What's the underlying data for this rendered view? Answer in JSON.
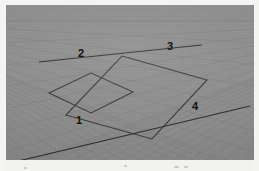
{
  "scene": {
    "title": "3D perspective grid viewport",
    "background_color": "#8d8d8d",
    "paper_color": "#f4f4f2",
    "grid_line_color": "#7c7c7c",
    "geometry_line_color": "#3a3a3a",
    "axis_line_color": "#2f2f2f",
    "label_color": "#141414",
    "canvas": {
      "x": 6,
      "y": 5,
      "width": 248,
      "height": 155
    }
  },
  "grid": {
    "name": "perspective-ground-grid",
    "description": "Ground plane grid receding to a horizon, drawn as two families of parallel lines",
    "horizon_y": 16,
    "family_a_count": 26,
    "family_b_count": 26
  },
  "axes": [
    {
      "id": "axis-1",
      "name": "axis-line-primary",
      "from": {
        "x": 4,
        "y": 158
      },
      "to": {
        "x": 244,
        "y": 101
      }
    },
    {
      "id": "axis-2",
      "name": "axis-line-secondary",
      "from": {
        "x": 33,
        "y": 57
      },
      "to": {
        "x": 196,
        "y": 40
      }
    }
  ],
  "shapes": [
    {
      "id": "quad-1",
      "name": "ground-quad-left",
      "points": "43,88 85,68 127,87 85,108"
    },
    {
      "id": "quad-2",
      "name": "ground-quad-right",
      "points": "116,51 201,75 146,134 60,110"
    }
  ],
  "labels": [
    {
      "id": "label-1",
      "name": "callout-label-1",
      "text": "1",
      "x": 70,
      "y": 110
    },
    {
      "id": "label-2",
      "name": "callout-label-2",
      "text": "2",
      "x": 72,
      "y": 43
    },
    {
      "id": "label-3",
      "name": "callout-label-3",
      "text": "3",
      "x": 161,
      "y": 36
    },
    {
      "id": "label-4",
      "name": "callout-label-4",
      "text": "4",
      "x": 186,
      "y": 96
    }
  ],
  "artifacts": [
    {
      "x": 118,
      "y": 5,
      "width": 3
    },
    {
      "x": 168,
      "y": 6,
      "width": 5
    },
    {
      "x": 178,
      "y": 6,
      "width": 4
    },
    {
      "x": 18,
      "y": 7,
      "width": 3
    }
  ]
}
